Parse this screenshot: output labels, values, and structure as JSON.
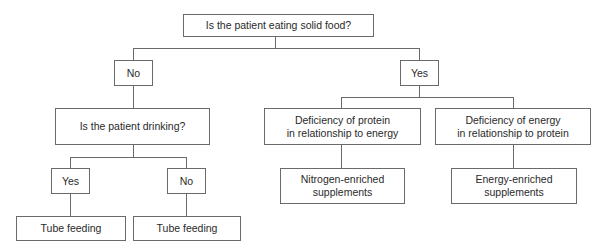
{
  "diagram": {
    "type": "decision-tree",
    "nodes": {
      "root": "Is the patient eating solid food?",
      "no": "No",
      "yes": "Yes",
      "drinking": "Is the patient drinking?",
      "drinking_yes": "Yes",
      "drinking_no": "No",
      "tube_left": "Tube feeding",
      "tube_right": "Tube feeding",
      "protein_deficiency_line1": "Deficiency of protein",
      "protein_deficiency_line2": "in relationship to energy",
      "energy_deficiency_line1": "Deficiency of energy",
      "energy_deficiency_line2": "in relationship to protein",
      "nitrogen_line1": "Nitrogen-enriched",
      "nitrogen_line2": "supplements",
      "energy_line1": "Energy-enriched",
      "energy_line2": "supplements"
    },
    "edges": [
      [
        "root",
        "no"
      ],
      [
        "root",
        "yes"
      ],
      [
        "no",
        "drinking"
      ],
      [
        "drinking",
        "drinking_yes"
      ],
      [
        "drinking",
        "drinking_no"
      ],
      [
        "drinking_yes",
        "tube_left"
      ],
      [
        "drinking_no",
        "tube_right"
      ],
      [
        "yes",
        "protein_deficiency"
      ],
      [
        "yes",
        "energy_deficiency"
      ],
      [
        "protein_deficiency",
        "nitrogen_enriched"
      ],
      [
        "energy_deficiency",
        "energy_enriched"
      ]
    ]
  }
}
